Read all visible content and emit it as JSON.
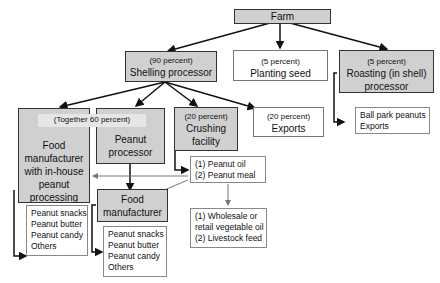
{
  "diagram": {
    "nodes": {
      "farm": {
        "label": "Farm"
      },
      "shelling": {
        "percent": "(90 percent)",
        "label": "Shelling processor"
      },
      "planting": {
        "percent": "(5 percent)",
        "label": "Planting seed"
      },
      "roasting": {
        "percent": "(5 percent)",
        "label": "Roasting (in shell) processor"
      },
      "together": {
        "label": "(Together 60 percent)"
      },
      "food_inhouse": {
        "label": "Food manufacturer with in-house peanut processing"
      },
      "peanut_processor": {
        "label": "Peanut processor"
      },
      "crushing": {
        "percent": "(20 percent)",
        "label": "Crushing facility"
      },
      "exports": {
        "percent": "(20 percent)",
        "label": "Exports"
      },
      "food_manufacturer": {
        "label": "Food manufacturer"
      }
    },
    "lists": {
      "roasting_products": [
        "Ball park peanuts",
        "Exports"
      ],
      "crushing_products": [
        "(1) Peanut oil",
        "(2) Peanut meal"
      ],
      "crushing_uses": [
        "(1) Wholesale or",
        "retail vegetable oil",
        "(2) Livestock feed"
      ],
      "inhouse_products": [
        "Peanut snacks",
        "Peanut butter",
        "Peanut candy",
        "Others"
      ],
      "manufacturer_products": [
        "Peanut snacks",
        "Peanut butter",
        "Peanut candy",
        "Others"
      ]
    }
  }
}
